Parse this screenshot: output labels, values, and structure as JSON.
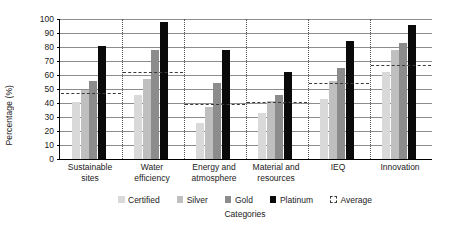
{
  "chart_data": {
    "type": "bar",
    "title": "",
    "xlabel": "Categories",
    "ylabel": "Percentage (%)",
    "ylim": [
      0,
      100
    ],
    "ytick_step": 10,
    "yticks": [
      0,
      10,
      20,
      30,
      40,
      50,
      60,
      70,
      80,
      90,
      100
    ],
    "grid": true,
    "legend_position": "bottom",
    "categories": [
      "Sustainable sites",
      "Water efficiency",
      "Energy and atmosphere",
      "Material and resources",
      "IEQ",
      "Innovation"
    ],
    "category_lines": [
      [
        "Sustainable",
        "sites"
      ],
      [
        "Water",
        "efficiency"
      ],
      [
        "Energy and",
        "atmosphere"
      ],
      [
        "Material and",
        "resources"
      ],
      [
        "IEQ",
        ""
      ],
      [
        "Innovation",
        ""
      ]
    ],
    "series": [
      {
        "name": "Certified",
        "type": "bar",
        "color": "#d9d9d9",
        "values": [
          41,
          46,
          25.5,
          33,
          43,
          62
        ]
      },
      {
        "name": "Silver",
        "type": "bar",
        "color": "#bfbfbf",
        "values": [
          49,
          57.5,
          37.5,
          41.5,
          56,
          78
        ]
      },
      {
        "name": "Gold",
        "type": "bar",
        "color": "#8c8c8c",
        "values": [
          55.5,
          78,
          54,
          45.5,
          65,
          83
        ]
      },
      {
        "name": "Platinum",
        "type": "bar",
        "color": "#0a0a0a",
        "values": [
          81,
          98,
          78,
          62,
          84,
          96
        ]
      },
      {
        "name": "Average",
        "type": "dashed-line",
        "color": "#3a3a3a",
        "values": [
          46.5,
          61.5,
          38.5,
          40,
          53.5,
          66.5
        ]
      }
    ]
  },
  "legend": {
    "items": [
      {
        "label": "Certified",
        "key": "certified"
      },
      {
        "label": "Silver",
        "key": "silver"
      },
      {
        "label": "Gold",
        "key": "gold"
      },
      {
        "label": "Platinum",
        "key": "platinum"
      },
      {
        "label": "Average",
        "key": "average"
      }
    ]
  }
}
